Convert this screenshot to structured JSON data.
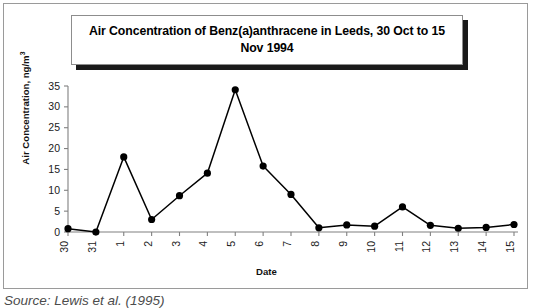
{
  "figure": {
    "source_caption": "Source: Lewis et al. (1995)"
  },
  "chart_data": {
    "type": "line",
    "title": "Air Concentration of Benz(a)anthracene in Leeds, 30 Oct to 15 Nov 1994",
    "xlabel": "Date",
    "ylabel": "Air Concentration, ng/m",
    "ylabel_superscript": "3",
    "categories": [
      "30",
      "31",
      "1",
      "2",
      "3",
      "4",
      "5",
      "6",
      "7",
      "8",
      "9",
      "10",
      "11",
      "12",
      "13",
      "14",
      "15"
    ],
    "values": [
      0.8,
      0.0,
      18.0,
      3.0,
      8.7,
      14.1,
      34.1,
      15.8,
      9.0,
      1.0,
      1.7,
      1.4,
      6.0,
      1.6,
      0.9,
      1.1,
      1.8
    ],
    "yticks": [
      0,
      5,
      10,
      15,
      20,
      25,
      30,
      35
    ],
    "ylim": [
      0,
      35
    ],
    "grid": false,
    "legend": "none",
    "marker": "filled-circle",
    "line_color": "#000000",
    "marker_color": "#000000",
    "axis_color": "#808080"
  }
}
